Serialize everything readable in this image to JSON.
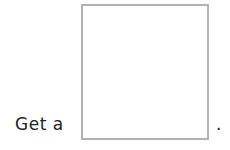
{
  "prompt": {
    "text": "Get a",
    "period": "."
  },
  "answer_box": {
    "border_color": "#b3b3b3",
    "content": ""
  }
}
